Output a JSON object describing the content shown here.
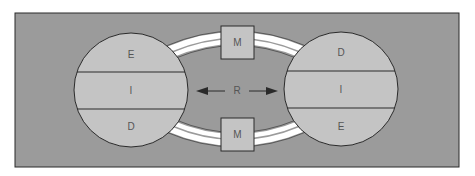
{
  "diagram": {
    "colors": {
      "background": "#9b9b9b",
      "circle_fill": "#c4c4c4",
      "box_fill": "#c4c4c4",
      "band": "#ffffff",
      "stroke": "#2a2a2a",
      "label": "#555555"
    },
    "left_circle": {
      "top_label": "E",
      "middle_label": "I",
      "bottom_label": "D"
    },
    "right_circle": {
      "top_label": "D",
      "middle_label": "I",
      "bottom_label": "E"
    },
    "top_box": {
      "label": "M"
    },
    "bottom_box": {
      "label": "M"
    },
    "center": {
      "label": "R",
      "left_arrow": "arrow-left",
      "right_arrow": "arrow-right"
    }
  }
}
